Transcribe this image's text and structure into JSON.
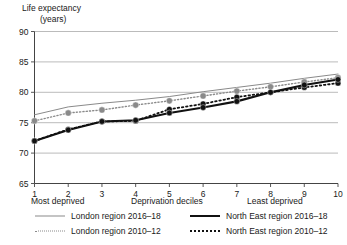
{
  "chart_data": {
    "type": "line",
    "ylabel_line1": "Life expectancy",
    "ylabel_line2": "(years)",
    "xlabel": "Deprivation deciles",
    "xlabel_left": "Most deprived",
    "xlabel_right": "Least deprived",
    "categories": [
      "1",
      "2",
      "3",
      "4",
      "5",
      "6",
      "7",
      "8",
      "9",
      "10"
    ],
    "x": [
      1,
      2,
      3,
      4,
      5,
      6,
      7,
      8,
      9,
      10
    ],
    "ylim": [
      65,
      90
    ],
    "yticks": [
      65,
      70,
      75,
      80,
      85,
      90
    ],
    "xlim": [
      1,
      10
    ],
    "grid": "horizontal",
    "legend_position": "bottom",
    "series": [
      {
        "name": "London region 2016–18",
        "values": [
          76.3,
          77.6,
          78.2,
          78.7,
          79.3,
          80.1,
          80.8,
          81.5,
          82.3,
          83.0
        ],
        "color": "#8a8a8a",
        "style": "solid",
        "width": 1,
        "markers": false
      },
      {
        "name": "London region 2010–12",
        "values": [
          75.3,
          76.6,
          77.1,
          77.9,
          78.6,
          79.4,
          80.2,
          80.9,
          81.7,
          82.4
        ],
        "color": "#8a8a8a",
        "style": "dotted",
        "width": 1.4,
        "markers": true
      },
      {
        "name": "North East region 2016–18",
        "values": [
          72.0,
          73.8,
          75.2,
          75.4,
          76.6,
          77.5,
          78.5,
          80.0,
          81.2,
          82.1
        ],
        "color": "#111111",
        "style": "solid",
        "width": 2.2,
        "markers": true
      },
      {
        "name": "North East region 2010–12",
        "values": [
          72.0,
          73.9,
          75.2,
          75.3,
          77.2,
          78.1,
          79.2,
          80.0,
          80.8,
          81.5
        ],
        "color": "#111111",
        "style": "dotted",
        "width": 1.8,
        "markers": true
      }
    ]
  },
  "legend": {
    "items": [
      {
        "label": "London region 2016–18",
        "swatch": "sw-lon-new"
      },
      {
        "label": "London region 2010–12",
        "swatch": "sw-lon-old"
      },
      {
        "label": "North East region 2016–18",
        "swatch": "sw-ne-new"
      },
      {
        "label": "North East region 2010–12",
        "swatch": "sw-ne-old"
      }
    ]
  },
  "colors": {
    "london": "#8a8a8a",
    "north_east": "#111111",
    "grid": "#aaaaaa",
    "axis": "#444444"
  }
}
